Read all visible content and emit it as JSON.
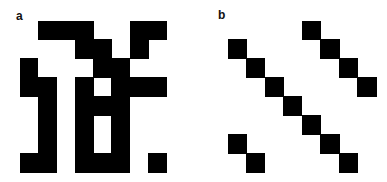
{
  "figure": {
    "background": "#ffffff",
    "cell_color": "#000000",
    "panels": [
      {
        "label": "a",
        "rows": 8,
        "cols": 8,
        "cells": [
          [
            0,
            1,
            1,
            1,
            0,
            0,
            1,
            1
          ],
          [
            0,
            0,
            0,
            1,
            1,
            0,
            1,
            0
          ],
          [
            1,
            0,
            0,
            0,
            1,
            1,
            0,
            0
          ],
          [
            1,
            1,
            0,
            1,
            0,
            1,
            1,
            1
          ],
          [
            0,
            1,
            0,
            1,
            1,
            1,
            0,
            0
          ],
          [
            0,
            1,
            0,
            1,
            0,
            1,
            0,
            0
          ],
          [
            0,
            1,
            0,
            1,
            0,
            1,
            0,
            0
          ],
          [
            1,
            1,
            0,
            1,
            1,
            1,
            0,
            1
          ]
        ]
      },
      {
        "label": "b",
        "rows": 8,
        "cols": 8,
        "cells": [
          [
            0,
            0,
            0,
            0,
            1,
            0,
            0,
            0
          ],
          [
            1,
            0,
            0,
            0,
            0,
            1,
            0,
            0
          ],
          [
            0,
            1,
            0,
            0,
            0,
            0,
            1,
            0
          ],
          [
            0,
            0,
            1,
            0,
            0,
            0,
            0,
            1
          ],
          [
            0,
            0,
            0,
            1,
            0,
            0,
            0,
            0
          ],
          [
            0,
            0,
            0,
            0,
            1,
            0,
            0,
            0
          ],
          [
            1,
            0,
            0,
            0,
            0,
            1,
            0,
            0
          ],
          [
            0,
            1,
            0,
            0,
            0,
            0,
            1,
            0
          ]
        ]
      }
    ]
  }
}
